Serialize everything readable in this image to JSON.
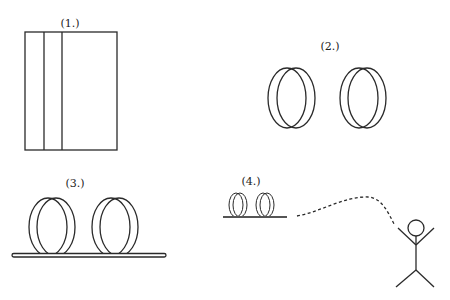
{
  "panels": [
    {
      "id": "panel-1",
      "label": "(1.)",
      "description": "rectangle divided by two vertical lines"
    },
    {
      "id": "panel-2",
      "label": "(2.)",
      "description": "two rings"
    },
    {
      "id": "panel-3",
      "label": "(3.)",
      "description": "two rings resting on a bar"
    },
    {
      "id": "panel-4",
      "label": "(4.)",
      "description": "small rings on bar with dashed trajectory to stick figure"
    }
  ],
  "colors": {
    "stroke": "#2a2a2a",
    "background": "#ffffff"
  }
}
